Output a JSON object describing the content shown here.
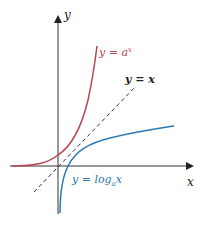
{
  "diagram": {
    "title": "",
    "axes": {
      "x_label": "x",
      "y_label": "y"
    },
    "curves": [
      {
        "id": "exp",
        "label_y": "y = ",
        "label_base": "a",
        "label_sup": "x",
        "color": "#b5474f"
      },
      {
        "id": "log",
        "label_y": "y = log",
        "label_sub": "a",
        "label_x": "x",
        "color": "#2a7ab0"
      },
      {
        "id": "identity",
        "label": "y = x",
        "color": "#222222",
        "style": "dashed"
      }
    ]
  }
}
